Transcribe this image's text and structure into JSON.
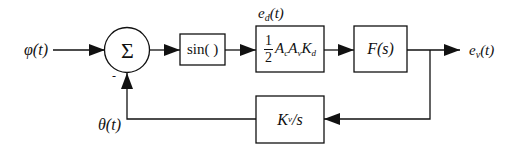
{
  "diagram": {
    "type": "block-diagram",
    "colors": {
      "stroke": "#111111",
      "background": "#ffffff"
    },
    "signals": {
      "input": {
        "symbol": "φ",
        "arg": "(t)"
      },
      "feedback": {
        "symbol": "θ",
        "arg": "(t)"
      },
      "detector_output": {
        "symbol": "e",
        "sub": "d",
        "arg": "(t)"
      },
      "output": {
        "symbol": "e",
        "sub": "v",
        "arg": "(t)"
      },
      "minus_sign": "-"
    },
    "blocks": {
      "summer": {
        "symbol": "Σ"
      },
      "nonlinearity": {
        "label": "sin( )"
      },
      "gain": {
        "frac_num": "1",
        "frac_den": "2",
        "terms": [
          {
            "base": "A",
            "sub": "c"
          },
          {
            "base": "A",
            "sub": "v"
          },
          {
            "base": "K",
            "sub": "d"
          }
        ]
      },
      "loop_filter": {
        "label": "F(s)"
      },
      "vco": {
        "base": "K",
        "sub": "v",
        "rest": "/s"
      }
    }
  }
}
